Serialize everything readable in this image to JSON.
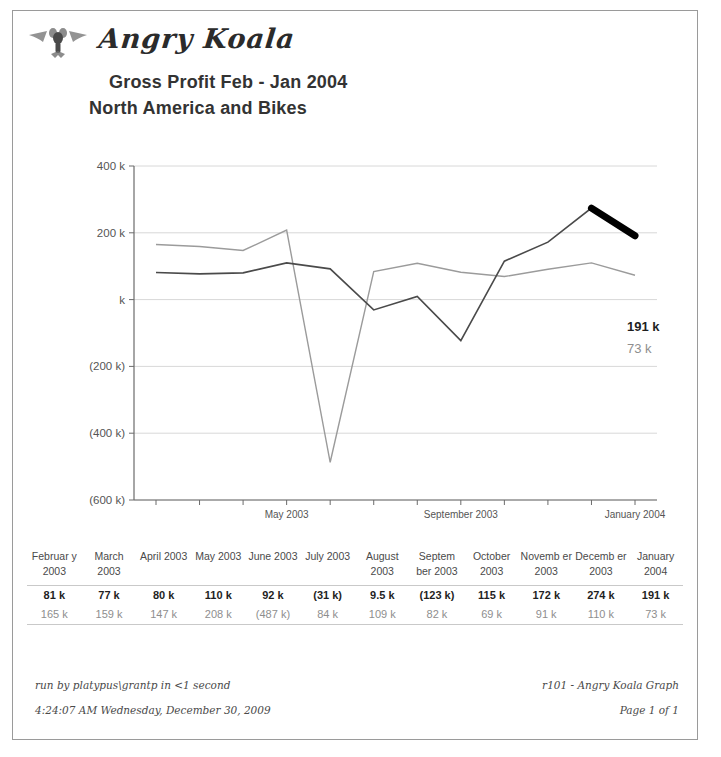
{
  "brand": {
    "name": "Angry Koala",
    "logo_icon": "koala-emblem-icon"
  },
  "report": {
    "title": "Gross Profit  Feb - Jan 2004",
    "subtitle": "North America  and  Bikes"
  },
  "end_labels": {
    "dark": "191 k",
    "light": "73 k"
  },
  "footer": {
    "run_by": "run by platypus\\grantp in <1 second",
    "timestamp": "4:24:07 AM Wednesday, December 30, 2009",
    "report_id": "r101 - Angry Koala Graph",
    "page": "Page 1 of 1"
  },
  "table": {
    "headers": [
      "Februar y 2003",
      "March 2003",
      "April 2003",
      "May 2003",
      "June 2003",
      "July 2003",
      "August 2003",
      "Septem ber 2003",
      "October 2003",
      "Novemb er 2003",
      "Decemb er 2003",
      "January 2004"
    ],
    "row_dark": [
      "81 k",
      "77 k",
      "80 k",
      "110 k",
      "92 k",
      "(31 k)",
      "9.5 k",
      "(123 k)",
      "115 k",
      "172 k",
      "274 k",
      "191 k"
    ],
    "row_light": [
      "165 k",
      "159 k",
      "147 k",
      "208 k",
      "(487 k)",
      "84 k",
      "109 k",
      "82 k",
      "69 k",
      "91 k",
      "110 k",
      "73 k"
    ]
  },
  "chart_data": {
    "type": "line",
    "title": "Gross Profit  Feb - Jan 2004",
    "subtitle": "North America  and  Bikes",
    "xlabel": "",
    "ylabel": "",
    "ylim": [
      -600000,
      400000
    ],
    "yticks": [
      400000,
      200000,
      0,
      -200000,
      -400000,
      -600000
    ],
    "ytick_labels": [
      "400 k",
      "200 k",
      "k",
      "(200 k)",
      "(400 k)",
      "(600 k)"
    ],
    "grid": true,
    "legend": "none",
    "categories": [
      "February 2003",
      "March 2003",
      "April 2003",
      "May 2003",
      "June 2003",
      "July 2003",
      "August 2003",
      "September 2003",
      "October 2003",
      "November 2003",
      "December 2003",
      "January 2004"
    ],
    "xtick_labels_upper": [
      "May 2003",
      "September 2003",
      "January 2004"
    ],
    "xtick_labels_lower": [
      "March 2003",
      "July 2003",
      "November 2003"
    ],
    "series": [
      {
        "name": "Gross Profit (current)",
        "color": "#4a4a4a",
        "emphasis_segment": [
          "December 2003",
          "January 2004"
        ],
        "values": [
          81000,
          77000,
          80000,
          110000,
          92000,
          -31000,
          9500,
          -123000,
          115000,
          172000,
          274000,
          191000
        ],
        "labels": [
          "81 k",
          "77 k",
          "80 k",
          "110 k",
          "92 k",
          "(31 k)",
          "9.5 k",
          "(123 k)",
          "115 k",
          "172 k",
          "274 k",
          "191 k"
        ],
        "end_label": "191 k"
      },
      {
        "name": "Gross Profit (comparison)",
        "color": "#9b9b9b",
        "values": [
          165000,
          159000,
          147000,
          208000,
          -487000,
          84000,
          109000,
          82000,
          69000,
          91000,
          110000,
          73000
        ],
        "labels": [
          "165 k",
          "159 k",
          "147 k",
          "208 k",
          "(487 k)",
          "84 k",
          "109 k",
          "82 k",
          "69 k",
          "91 k",
          "110 k",
          "73 k"
        ],
        "end_label": "73 k"
      }
    ]
  }
}
